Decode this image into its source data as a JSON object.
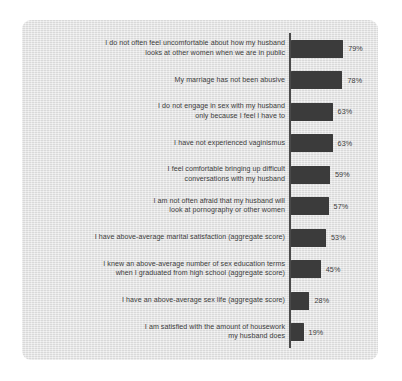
{
  "chart_data": {
    "type": "bar",
    "orientation": "horizontal",
    "title": "",
    "xlabel": "",
    "ylabel": "",
    "xlim": [
      0,
      100
    ],
    "grid": false,
    "legend": null,
    "value_suffix": "%",
    "bar_color": "#3b3b3b",
    "background_color": "#e3e3e3",
    "text_color": "#3c3c3c",
    "categories": [
      "I do not often feel uncomfortable about how my husband\nlooks at other women when we are in public",
      "My marriage has not been abusive",
      "I do not engage in sex with my husband\nonly because I feel I have to",
      "I have not experienced vaginismus",
      "I feel comfortable bringing up difficult\nconversations with my husband",
      "I am not often afraid that my husband will\nlook at pornography or other women",
      "I have above-average marital satisfaction (aggregate score)",
      "I knew an above-average number of sex education terms\nwhen I graduated from high school (aggregate score)",
      "I have an above-average sex life (aggregate score)",
      "I am satisfied with the amount of housework\nmy husband does"
    ],
    "values": [
      79,
      78,
      63,
      63,
      59,
      57,
      53,
      45,
      28,
      19
    ],
    "value_labels": [
      "79%",
      "78%",
      "63%",
      "63%",
      "59%",
      "57%",
      "53%",
      "45%",
      "28%",
      "19%"
    ]
  }
}
